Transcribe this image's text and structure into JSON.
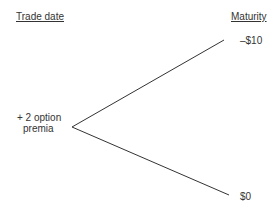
{
  "headers": {
    "left": "Trade date",
    "right": "Maturity"
  },
  "node_labels": {
    "origin_line1": "+ 2 option",
    "origin_line2": "premia",
    "upper_outcome": "–$10",
    "lower_outcome": "$0"
  },
  "colors": {
    "line": "#333333",
    "text": "#333333",
    "background": "#ffffff"
  }
}
